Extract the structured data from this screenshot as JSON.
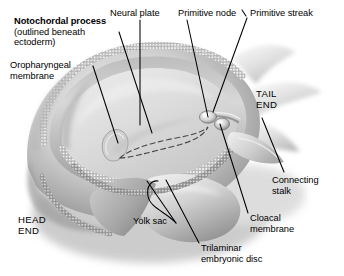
{
  "figure": {
    "background_color": "#ffffff",
    "ink_color": "#000000",
    "palette": {
      "disc_floor_light": "#e3e3e3",
      "disc_floor_mid": "#cfcfcf",
      "amnion_wall": "#b9b9b9",
      "amnion_shadow": "#8f8f8f",
      "yolk_sac": "#d6d6d6",
      "yolk_sac_shadow": "#9a9a9a",
      "outer_shadow": "#a8a8a8",
      "membrane_beads": "#f2f2f2",
      "groove_dark": "#7c7c7c"
    }
  },
  "labels": [
    {
      "id": "notochordal-process",
      "lines": [
        "Notochordal process",
        "(outlined beneath",
        "ectoderm)"
      ],
      "bold_first_line": true,
      "x": 14,
      "y": 16,
      "leader": {
        "x1": 119,
        "y1": 32,
        "x2": 152,
        "y2": 133
      }
    },
    {
      "id": "oropharyngeal-membrane",
      "lines": [
        "Oropharyngeal",
        "membrane"
      ],
      "bold_first_line": false,
      "x": 10,
      "y": 60,
      "leader": {
        "x1": 93,
        "y1": 66,
        "x2": 118,
        "y2": 143
      }
    },
    {
      "id": "neural-plate",
      "lines": [
        "Neural plate"
      ],
      "bold_first_line": false,
      "x": 110,
      "y": 8,
      "leader": {
        "x1": 140,
        "y1": 20,
        "x2": 140,
        "y2": 125
      }
    },
    {
      "id": "primitive-node",
      "lines": [
        "Primitive node"
      ],
      "bold_first_line": false,
      "x": 178,
      "y": 8,
      "leader": {
        "x1": 187,
        "y1": 20,
        "x2": 208,
        "y2": 117
      }
    },
    {
      "id": "primitive-streak",
      "lines": [
        "Primitive streak"
      ],
      "bold_first_line": false,
      "x": 250,
      "y": 8,
      "leader": {
        "x1": 247,
        "y1": 18,
        "x2": 213,
        "y2": 112
      }
    },
    {
      "id": "tail-end",
      "lines": [
        "TAIL",
        "END"
      ],
      "bold_first_line": false,
      "caps": true,
      "x": 256,
      "y": 88,
      "leader": null
    },
    {
      "id": "connecting-stalk",
      "lines": [
        "Connecting",
        "stalk"
      ],
      "bold_first_line": false,
      "x": 272,
      "y": 175,
      "leader": {
        "x1": 284,
        "y1": 172,
        "x2": 262,
        "y2": 118
      }
    },
    {
      "id": "cloacal-membrane",
      "lines": [
        "Cloacal",
        "membrane"
      ],
      "bold_first_line": false,
      "x": 250,
      "y": 213,
      "leader": {
        "x1": 248,
        "y1": 213,
        "x2": 220,
        "y2": 124
      }
    },
    {
      "id": "trilaminar-embryonic-disc",
      "lines": [
        "Trilaminar",
        "embryonic disc"
      ],
      "bold_first_line": false,
      "x": 201,
      "y": 243,
      "leader": {
        "x1": 199,
        "y1": 243,
        "x2": 166,
        "y2": 180
      }
    },
    {
      "id": "yolk-sac",
      "lines": [
        "Yolk sac"
      ],
      "bold_first_line": false,
      "x": 133,
      "y": 216,
      "leader": {
        "x1": 176,
        "y1": 223,
        "x2": 147,
        "y2": 181
      }
    },
    {
      "id": "head-end",
      "lines": [
        "HEAD",
        "END"
      ],
      "bold_first_line": false,
      "caps": true,
      "x": 18,
      "y": 214,
      "leader": null
    }
  ]
}
